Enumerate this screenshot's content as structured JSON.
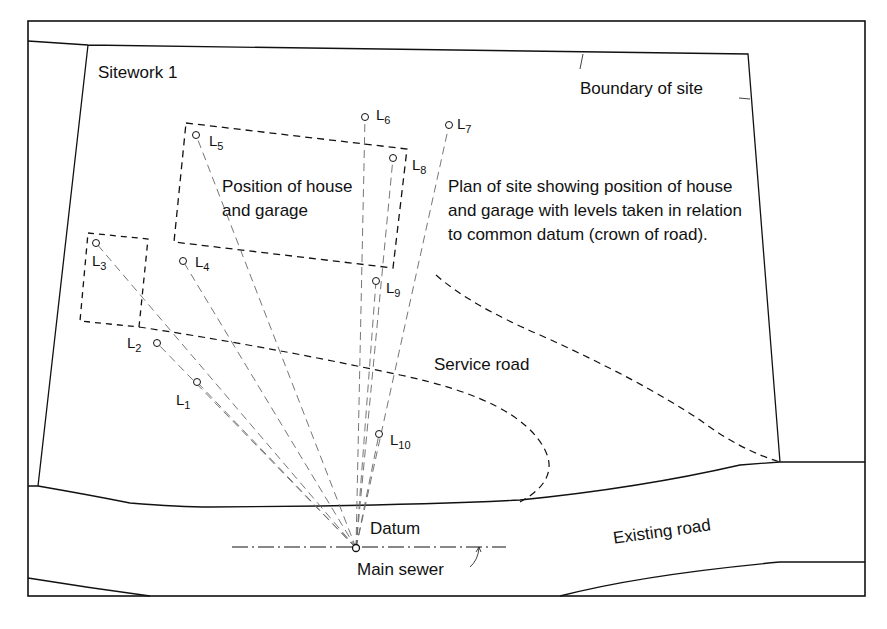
{
  "diagram": {
    "title": "Sitework 1",
    "labels": {
      "boundary": "Boundary of site",
      "house": [
        "Position of house",
        "and garage"
      ],
      "description": "Plan of site showing position of house and garage with levels taken in relation to common datum (crown of road).",
      "service_road": "Service road",
      "existing_road": "Existing road",
      "datum": "Datum",
      "main_sewer": "Main sewer"
    },
    "levels": [
      {
        "id": "L1",
        "base": "L",
        "sub": "1",
        "x": 197,
        "y": 382
      },
      {
        "id": "L2",
        "base": "L",
        "sub": "2",
        "x": 157,
        "y": 343
      },
      {
        "id": "L3",
        "base": "L",
        "sub": "3",
        "x": 96,
        "y": 243
      },
      {
        "id": "L4",
        "base": "L",
        "sub": "4",
        "x": 183,
        "y": 261
      },
      {
        "id": "L5",
        "base": "L",
        "sub": "5",
        "x": 196,
        "y": 135
      },
      {
        "id": "L6",
        "base": "L",
        "sub": "6",
        "x": 365,
        "y": 117
      },
      {
        "id": "L7",
        "base": "L",
        "sub": "7",
        "x": 449,
        "y": 125
      },
      {
        "id": "L8",
        "base": "L",
        "sub": "8",
        "x": 393,
        "y": 158
      },
      {
        "id": "L9",
        "base": "L",
        "sub": "9",
        "x": 376,
        "y": 281
      },
      {
        "id": "L10",
        "base": "L",
        "sub": "10",
        "x": 379,
        "y": 434
      }
    ],
    "datum_point": {
      "x": 356,
      "y": 548
    },
    "colors": {
      "ink": "#111111",
      "sight_line": "#666666",
      "background": "#ffffff"
    }
  }
}
